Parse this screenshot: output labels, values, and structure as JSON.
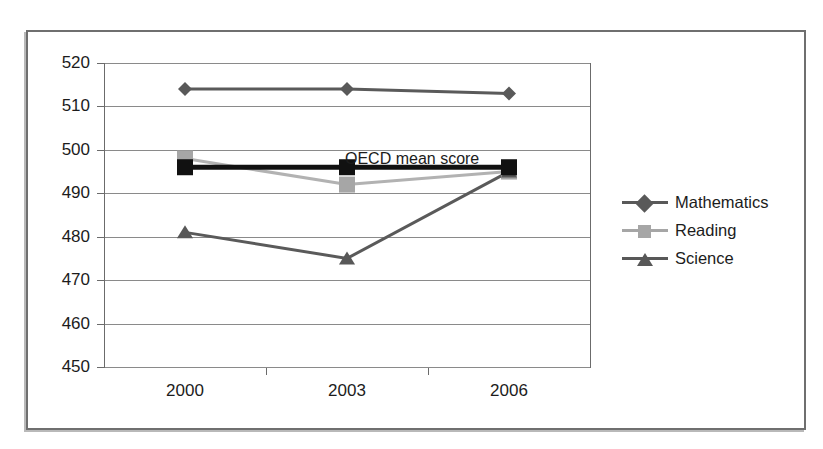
{
  "chart_data": {
    "type": "line",
    "title": "",
    "subtitle": "",
    "xlabel": "",
    "ylabel": "",
    "categories": [
      "2000",
      "2003",
      "2006"
    ],
    "x": [
      2000,
      2003,
      2006
    ],
    "ylim": [
      450,
      520
    ],
    "ytick_step": 10,
    "yticks": [
      520,
      510,
      500,
      490,
      480,
      470,
      460,
      450
    ],
    "grid": true,
    "legend_position": "right",
    "annotations": [
      {
        "text": "OECD mean score",
        "x": "2003",
        "y": 500
      }
    ],
    "series": [
      {
        "name": "Mathematics",
        "marker": "diamond",
        "color": "#595959",
        "line_color": "#5a5a5a",
        "values": [
          514,
          514,
          513
        ]
      },
      {
        "name": "Reading",
        "marker": "square",
        "color": "#a6a6a6",
        "line_color": "#b2b2b2",
        "values": [
          498,
          492,
          495
        ]
      },
      {
        "name": "Science",
        "marker": "triangle",
        "color": "#585858",
        "line_color": "#5a5a5a",
        "values": [
          481,
          475,
          495
        ]
      },
      {
        "name": "OECD mean score",
        "marker": "square",
        "color": "#111111",
        "line_color": "#111111",
        "values": [
          496,
          496,
          496
        ]
      }
    ]
  },
  "axes": {
    "y_labels": [
      "520",
      "510",
      "500",
      "490",
      "480",
      "470",
      "460",
      "450"
    ],
    "x_labels": [
      "2000",
      "2003",
      "2006"
    ]
  },
  "legend": {
    "items": [
      {
        "label": "Mathematics"
      },
      {
        "label": "Reading"
      },
      {
        "label": "Science"
      }
    ]
  },
  "annotation": {
    "oecd_label": "OECD mean score"
  },
  "colors": {
    "mathematics": "#595959",
    "reading": "#a6a6a6",
    "science": "#585858",
    "oecd_mean": "#111111",
    "gridline": "#8a8a8a",
    "axis": "#6b6b6b",
    "frame": "#6f6f6f",
    "text": "#1c1c1c",
    "background": "#ffffff"
  }
}
